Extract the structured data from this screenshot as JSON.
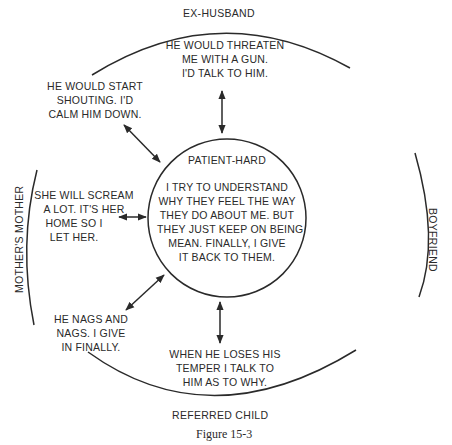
{
  "figure": {
    "caption": "Figure 15-3",
    "colors": {
      "ink": "#2a2a2a",
      "background": "#ffffff"
    }
  },
  "outer_labels": {
    "top": "EX-HUSBAND",
    "bottom": "REFERRED CHILD",
    "left": "MOTHER'S MOTHER",
    "right": "BOYFRIEND"
  },
  "center": {
    "title": "PATIENT-HARD",
    "lines": [
      "I TRY TO UNDERSTAND",
      "WHY THEY FEEL THE WAY",
      "THEY DO ABOUT ME. BUT",
      "THEY JUST KEEP ON BEING",
      "MEAN. FINALLY, I GIVE",
      "IT BACK TO THEM."
    ]
  },
  "responses": {
    "ex_husband_top": [
      "HE WOULD THREATEN",
      "ME WITH A GUN.",
      "I'D TALK TO HIM."
    ],
    "ex_husband_left": [
      "HE WOULD START",
      "SHOUTING. I'D",
      "CALM HIM DOWN."
    ],
    "mothers_mother": [
      "SHE WILL SCREAM",
      "A LOT. IT'S HER",
      "HOME SO I",
      "LET HER."
    ],
    "referred_child_left": [
      "HE NAGS AND",
      "NAGS. I GIVE",
      "IN FINALLY."
    ],
    "referred_child_bottom": [
      "WHEN HE LOSES HIS",
      "TEMPER I TALK TO",
      "HIM AS TO WHY."
    ]
  }
}
